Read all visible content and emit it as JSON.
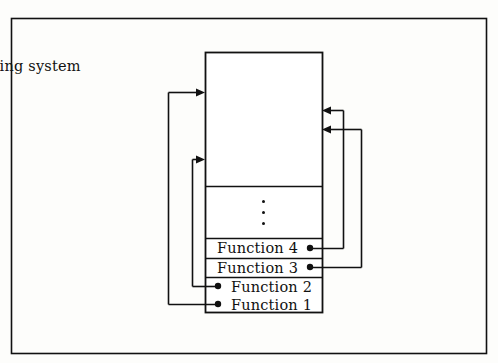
{
  "figure": {
    "kind": "block-diagram",
    "caption_text": "",
    "outer_frame": {
      "x": 11,
      "y": 18,
      "width": 476,
      "height": 336
    },
    "line_color": "#111111",
    "background_color": "#fdfdfb"
  },
  "os_block": {
    "title": "Operating system",
    "x": 205,
    "y": 52,
    "width": 117,
    "height": 261,
    "dividers_y": [
      186,
      238,
      258,
      277
    ],
    "ellipsis": {
      "label": "vertical-ellipsis",
      "dots": 3,
      "center_x": 263,
      "center_y": 211
    }
  },
  "functions": [
    {
      "label": "Function 4",
      "row_y": 238,
      "row_height": 20,
      "text_y": 241,
      "dot_side": "right",
      "dot_x": 310,
      "dot_y": 248,
      "route_x": 343,
      "arrow_y": 110,
      "arrow_dir": "left"
    },
    {
      "label": "Function 3",
      "row_y": 258,
      "row_height": 19,
      "text_y": 261,
      "dot_side": "right",
      "dot_x": 310,
      "dot_y": 267,
      "route_x": 361,
      "arrow_y": 129,
      "arrow_dir": "left"
    },
    {
      "label": "Function 2",
      "row_y": 277,
      "row_height": 18,
      "text_y": 280,
      "dot_side": "left",
      "dot_x": 218,
      "dot_y": 286,
      "route_x": 192,
      "arrow_y": 159,
      "arrow_dir": "right"
    },
    {
      "label": "Function 1",
      "row_y": 295,
      "row_height": 18,
      "text_y": 298,
      "dot_side": "left",
      "dot_x": 218,
      "dot_y": 304,
      "route_x": 168,
      "arrow_y": 92,
      "arrow_dir": "right"
    }
  ],
  "arrows": {
    "into_left_edge_x": 205,
    "into_right_edge_x": 322,
    "head_length": 9,
    "head_half_width": 4
  }
}
